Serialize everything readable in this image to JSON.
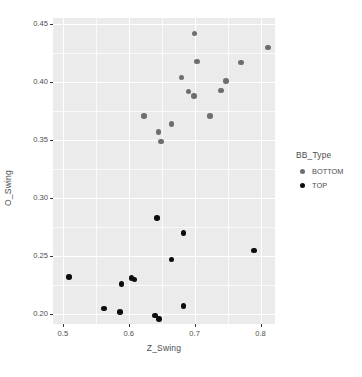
{
  "chart_data": {
    "type": "scatter",
    "title": "",
    "xlabel": "Z_Swing",
    "ylabel": "O_Swing",
    "xlim": [
      0.485,
      0.822
    ],
    "ylim": [
      0.1915,
      0.4555
    ],
    "xticks": [
      0.5,
      0.6,
      0.7,
      0.8
    ],
    "xticklabels": [
      "0.5",
      "0.6",
      "0.7",
      "0.8"
    ],
    "yticks": [
      0.2,
      0.25,
      0.3,
      0.35,
      0.4,
      0.45
    ],
    "yticklabels": [
      "0.20",
      "0.25",
      "0.30",
      "0.35",
      "0.40",
      "0.45"
    ],
    "xminor": [
      0.55,
      0.65,
      0.75
    ],
    "yminor": [
      0.225,
      0.275,
      0.325,
      0.375,
      0.425
    ],
    "grid": true,
    "panel_background": "#ebebeb",
    "grid_color": "#ffffff",
    "legend_position": "right",
    "legend": {
      "title": "BB_Type",
      "entries": [
        {
          "label": "BOTTOM",
          "color": "#6e6e6e"
        },
        {
          "label": "TOP",
          "color": "#0d0d0d"
        }
      ]
    },
    "series": [
      {
        "name": "BOTTOM",
        "color": "#6e6e6e",
        "points": [
          {
            "x": 0.7,
            "y": 0.442
          },
          {
            "x": 0.811,
            "y": 0.43
          },
          {
            "x": 0.704,
            "y": 0.418
          },
          {
            "x": 0.77,
            "y": 0.417
          },
          {
            "x": 0.68,
            "y": 0.404
          },
          {
            "x": 0.748,
            "y": 0.401
          },
          {
            "x": 0.74,
            "y": 0.393
          },
          {
            "x": 0.691,
            "y": 0.392
          },
          {
            "x": 0.699,
            "y": 0.388
          },
          {
            "x": 0.623,
            "y": 0.371
          },
          {
            "x": 0.723,
            "y": 0.371
          },
          {
            "x": 0.665,
            "y": 0.364
          },
          {
            "x": 0.645,
            "y": 0.357
          },
          {
            "x": 0.649,
            "y": 0.349
          }
        ]
      },
      {
        "name": "TOP",
        "color": "#0d0d0d",
        "points": [
          {
            "x": 0.643,
            "y": 0.283
          },
          {
            "x": 0.683,
            "y": 0.27
          },
          {
            "x": 0.79,
            "y": 0.255
          },
          {
            "x": 0.665,
            "y": 0.247
          },
          {
            "x": 0.509,
            "y": 0.232
          },
          {
            "x": 0.604,
            "y": 0.231
          },
          {
            "x": 0.609,
            "y": 0.23
          },
          {
            "x": 0.589,
            "y": 0.226
          },
          {
            "x": 0.683,
            "y": 0.207
          },
          {
            "x": 0.562,
            "y": 0.205
          },
          {
            "x": 0.587,
            "y": 0.202
          },
          {
            "x": 0.64,
            "y": 0.199
          },
          {
            "x": 0.646,
            "y": 0.196
          }
        ]
      }
    ]
  }
}
